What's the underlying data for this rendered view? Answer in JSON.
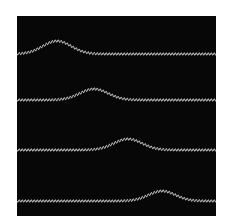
{
  "figure": {
    "background_color": "#070707",
    "wave_color": "#c8c8c8",
    "header_text": "",
    "panel": {
      "x": 17,
      "y": 16,
      "width": 199,
      "height": 200
    },
    "waves": [
      {
        "name": "wave-1",
        "baseline_y": 38,
        "peak_x": 40,
        "peak_height": 13,
        "width": 20
      },
      {
        "name": "wave-2",
        "baseline_y": 84,
        "peak_x": 77,
        "peak_height": 11,
        "width": 20
      },
      {
        "name": "wave-3",
        "baseline_y": 134,
        "peak_x": 111,
        "peak_height": 11,
        "width": 20
      },
      {
        "name": "wave-4",
        "baseline_y": 185,
        "peak_x": 145,
        "peak_height": 10,
        "width": 19
      }
    ],
    "ripple": {
      "wavelength": 3,
      "amplitude": 1.3
    }
  }
}
